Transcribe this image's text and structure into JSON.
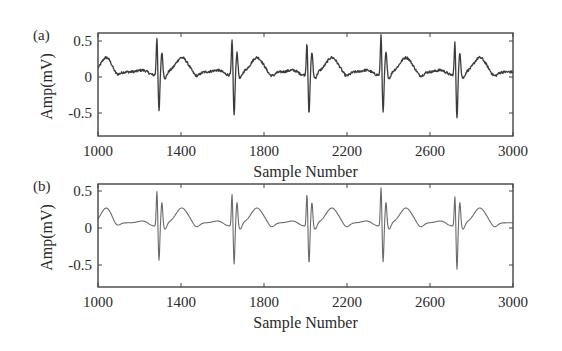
{
  "chart_data": [
    {
      "type": "line",
      "panel_label": "(a)",
      "title": "",
      "xlabel": "Sample Number",
      "ylabel": "Amp(mV)",
      "xlim": [
        1000,
        3000
      ],
      "ylim": [
        -0.8,
        0.6
      ],
      "xticks": [
        1000,
        1400,
        1800,
        2200,
        2600,
        3000
      ],
      "xtick_labels": [
        "1000",
        "1400",
        "1800",
        "2200",
        "2600",
        "3000"
      ],
      "yticks": [
        0.5,
        0,
        -0.5
      ],
      "ytick_labels": [
        "0.5",
        "0",
        "-0.5"
      ],
      "grid": false,
      "line_color": "#3c3c3c",
      "noisy": true,
      "description": "Noisy ECG signal",
      "r_peaks": [
        1284,
        1646,
        2007,
        2364,
        2720
      ],
      "r_peak_values": [
        0.52,
        0.48,
        0.45,
        0.56,
        0.45
      ],
      "s_trough_values": [
        -0.52,
        -0.58,
        -0.56,
        -0.54,
        -0.62
      ],
      "t_wave_value": 0.2,
      "baseline": -0.03
    },
    {
      "type": "line",
      "panel_label": "(b)",
      "title": "",
      "xlabel": "Sample Number",
      "ylabel": "Amp(mV)",
      "xlim": [
        1000,
        3000
      ],
      "ylim": [
        -0.8,
        0.6
      ],
      "xticks": [
        1000,
        1400,
        1800,
        2200,
        2600,
        3000
      ],
      "xtick_labels": [
        "1000",
        "1400",
        "1800",
        "2200",
        "2600",
        "3000"
      ],
      "yticks": [
        0.5,
        0,
        -0.5
      ],
      "ytick_labels": [
        "0.5",
        "0",
        "-0.5"
      ],
      "grid": false,
      "line_color": "#6a6a6a",
      "noisy": false,
      "description": "Denoised ECG signal",
      "r_peaks": [
        1284,
        1646,
        2007,
        2364,
        2720
      ],
      "r_peak_values": [
        0.47,
        0.43,
        0.43,
        0.52,
        0.4
      ],
      "s_trough_values": [
        -0.48,
        -0.53,
        -0.52,
        -0.5,
        -0.6
      ],
      "t_wave_value": 0.2,
      "baseline": -0.03
    }
  ]
}
